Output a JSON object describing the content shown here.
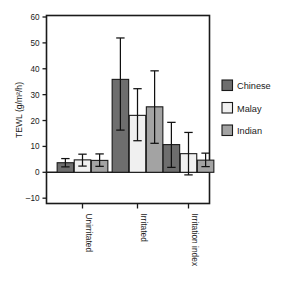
{
  "chart_data": {
    "type": "bar",
    "title": "",
    "xlabel": "",
    "ylabel": "TEWL (g/m²/h)",
    "categories": [
      "Unirritated",
      "Irritated",
      "Irritation index"
    ],
    "ylim": [
      -10,
      60
    ],
    "yticks": [
      -10,
      0,
      10,
      20,
      30,
      40,
      50,
      60
    ],
    "ytick_labels": [
      "–10",
      "0",
      "10",
      "20",
      "30",
      "40",
      "50",
      "60"
    ],
    "grid": false,
    "legend_position": "right",
    "error_bars": "whisker-caps",
    "series": [
      {
        "name": "Chinese",
        "color": "#6e6e6e",
        "values": [
          3.7,
          35.9,
          10.7
        ],
        "err_low": [
          2.1,
          16.3,
          1.9
        ],
        "err_high": [
          5.3,
          51.9,
          19.3
        ]
      },
      {
        "name": "Malay",
        "color": "#f0f0f0",
        "values": [
          4.8,
          22.0,
          7.2
        ],
        "err_low": [
          2.4,
          12.2,
          -1.0
        ],
        "err_high": [
          7.0,
          32.3,
          15.4
        ]
      },
      {
        "name": "Indian",
        "color": "#a3a3a3",
        "values": [
          4.6,
          25.3,
          4.7
        ],
        "err_low": [
          2.3,
          11.2,
          2.2
        ],
        "err_high": [
          7.1,
          39.2,
          7.4
        ]
      }
    ]
  },
  "legend": {
    "items": [
      {
        "label": "Chinese",
        "color": "#6e6e6e"
      },
      {
        "label": "Malay",
        "color": "#f0f0f0"
      },
      {
        "label": "Indian",
        "color": "#a3a3a3"
      }
    ]
  },
  "axis": {
    "y_label": "TEWL (g/m²/h)",
    "y_tick_labels": [
      "60",
      "50",
      "40",
      "30",
      "20",
      "10",
      "0",
      "–10"
    ],
    "x_tick_labels": [
      "Unirritated",
      "Irritated",
      "Irritation index"
    ]
  }
}
